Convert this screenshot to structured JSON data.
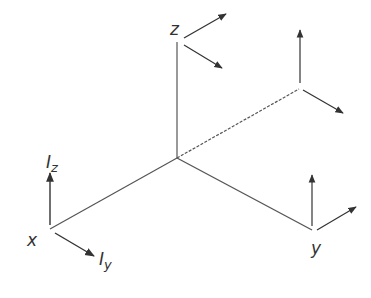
{
  "diagram": {
    "type": "3d-axes",
    "colors": {
      "line": "#555555",
      "arrow": "#333333",
      "text": "#333333",
      "background": "#ffffff"
    },
    "labels": {
      "z_axis": "z",
      "x_axis": "x",
      "y_axis": "y",
      "i_z": "I",
      "i_z_sub": "z",
      "i_y": "I",
      "i_y_sub": "y"
    },
    "axes": [
      {
        "name": "z",
        "from": [
          177,
          158
        ],
        "to": [
          177,
          42
        ]
      },
      {
        "name": "x",
        "from": [
          177,
          158
        ],
        "to": [
          50,
          229
        ]
      },
      {
        "name": "y",
        "from": [
          177,
          158
        ],
        "to": [
          312,
          230
        ]
      },
      {
        "name": "dashed-diagonal",
        "from": [
          177,
          158
        ],
        "to": [
          300,
          88
        ],
        "dashed": true
      }
    ]
  }
}
